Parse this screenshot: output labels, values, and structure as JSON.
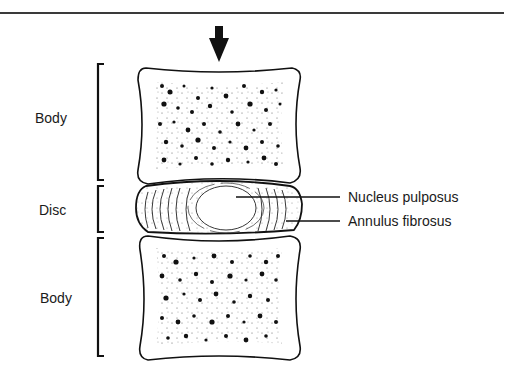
{
  "figure": {
    "title": "",
    "arrow_direction": "down",
    "left_labels": {
      "upper_body": "Body",
      "disc": "Disc",
      "lower_body": "Body"
    },
    "right_labels": {
      "nucleus": "Nucleus pulposus",
      "annulus": "Annulus fibrosus"
    },
    "colors": {
      "ink": "#1a1a1a",
      "background": "#ffffff",
      "rule": "#3a3a3a"
    }
  }
}
